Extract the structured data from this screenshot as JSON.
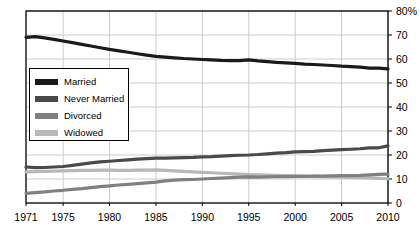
{
  "chart_data": {
    "type": "line",
    "title": "",
    "subtitle": "",
    "xlabel": "",
    "ylabel": "",
    "xlim": [
      1971,
      2010
    ],
    "ylim": [
      0,
      80
    ],
    "grid": true,
    "legend_position": "inside-left",
    "x_tick_labels": [
      "1971",
      "1975",
      "1980",
      "1985",
      "1990",
      "1995",
      "2000",
      "2005",
      "2010"
    ],
    "x_ticks": [
      1971,
      1975,
      1980,
      1985,
      1990,
      1995,
      2000,
      2005,
      2010
    ],
    "y_tick_labels": [
      "0",
      "10",
      "20",
      "30",
      "40",
      "50",
      "60",
      "70",
      "80%"
    ],
    "y_ticks": [
      0,
      10,
      20,
      30,
      40,
      50,
      60,
      70,
      80
    ],
    "x": [
      1971,
      1972,
      1973,
      1974,
      1975,
      1976,
      1977,
      1978,
      1979,
      1980,
      1981,
      1982,
      1983,
      1984,
      1985,
      1986,
      1987,
      1988,
      1989,
      1990,
      1991,
      1992,
      1993,
      1994,
      1995,
      1996,
      1997,
      1998,
      1999,
      2000,
      2001,
      2002,
      2003,
      2004,
      2005,
      2006,
      2007,
      2008,
      2009,
      2010
    ],
    "series": [
      {
        "name": "Married",
        "color": "#1a1a1a",
        "values": [
          69.0,
          69.3,
          68.8,
          68.2,
          67.5,
          66.8,
          66.1,
          65.4,
          64.7,
          64.0,
          63.4,
          62.8,
          62.2,
          61.6,
          61.1,
          60.8,
          60.5,
          60.2,
          60.0,
          59.8,
          59.6,
          59.4,
          59.3,
          59.3,
          59.6,
          59.2,
          58.9,
          58.6,
          58.4,
          58.2,
          57.9,
          57.7,
          57.5,
          57.3,
          57.0,
          56.8,
          56.6,
          56.2,
          56.2,
          55.9
        ]
      },
      {
        "name": "Never Married",
        "color": "#4a4a4a",
        "values": [
          15.0,
          14.7,
          14.8,
          15.0,
          15.2,
          15.7,
          16.2,
          16.7,
          17.1,
          17.4,
          17.7,
          18.0,
          18.3,
          18.5,
          18.7,
          18.7,
          18.8,
          18.9,
          19.0,
          19.2,
          19.3,
          19.5,
          19.7,
          19.9,
          20.0,
          20.2,
          20.5,
          20.8,
          21.0,
          21.3,
          21.4,
          21.5,
          21.8,
          22.0,
          22.2,
          22.4,
          22.6,
          23.0,
          23.0,
          23.8
        ]
      },
      {
        "name": "Divorced",
        "color": "#808080",
        "values": [
          4.0,
          4.3,
          4.6,
          5.0,
          5.3,
          5.7,
          6.0,
          6.4,
          6.8,
          7.1,
          7.5,
          7.8,
          8.1,
          8.4,
          8.7,
          9.2,
          9.5,
          9.7,
          9.8,
          10.0,
          10.2,
          10.4,
          10.6,
          10.8,
          10.9,
          10.8,
          10.9,
          11.0,
          11.0,
          11.1,
          11.1,
          11.2,
          11.2,
          11.3,
          11.4,
          11.4,
          11.5,
          11.7,
          11.9,
          12.0
        ]
      },
      {
        "name": "Widowed",
        "color": "#b8b8b8",
        "values": [
          13.0,
          13.1,
          13.2,
          13.3,
          13.4,
          13.5,
          13.6,
          13.6,
          13.7,
          13.7,
          13.6,
          13.6,
          13.7,
          13.7,
          13.8,
          13.6,
          13.4,
          13.2,
          13.0,
          12.8,
          12.6,
          12.4,
          12.2,
          12.0,
          11.8,
          11.7,
          11.6,
          11.5,
          11.4,
          11.3,
          11.2,
          11.1,
          11.0,
          10.9,
          10.8,
          10.7,
          10.6,
          10.5,
          10.3,
          10.1
        ]
      }
    ]
  },
  "legend": {
    "items": [
      {
        "label": "Married",
        "color": "#1a1a1a"
      },
      {
        "label": "Never Married",
        "color": "#4a4a4a"
      },
      {
        "label": "Divorced",
        "color": "#808080"
      },
      {
        "label": "Widowed",
        "color": "#b8b8b8"
      }
    ]
  },
  "style": {
    "plot_border_color": "#000000",
    "grid_color": "#cccccc",
    "background": "#ffffff"
  }
}
